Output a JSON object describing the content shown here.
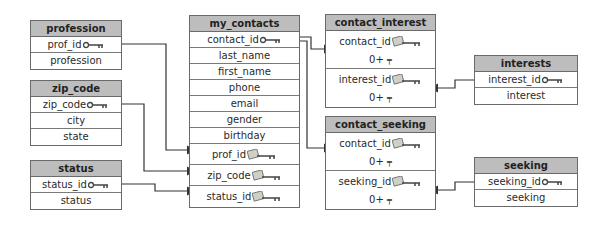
{
  "tables": {
    "profession": {
      "title": "profession",
      "fields": [
        "prof_id",
        "profession"
      ]
    },
    "zip_code": {
      "title": "zip_code",
      "fields": [
        "zip_code",
        "city",
        "state"
      ]
    },
    "status": {
      "title": "status",
      "fields": [
        "status_id",
        "status"
      ]
    },
    "my_contacts": {
      "title": "my_contacts",
      "fields": [
        "contact_id",
        "last_name",
        "first_name",
        "phone",
        "email",
        "gender",
        "birthday",
        "prof_id",
        "zip_code",
        "status_id"
      ]
    },
    "contact_interest": {
      "title": "contact_interest",
      "fields": [
        "contact_id",
        "interest_id"
      ],
      "cardinality": "0+"
    },
    "contact_seeking": {
      "title": "contact_seeking",
      "fields": [
        "contact_id",
        "seeking_id"
      ],
      "cardinality": "0+"
    },
    "interests": {
      "title": "interests",
      "fields": [
        "interest_id",
        "interest"
      ]
    },
    "seeking": {
      "title": "seeking",
      "fields": [
        "seeking_id",
        "seeking"
      ]
    }
  },
  "icons": {
    "primary_key": "key-icon",
    "foreign_key": "foreign-key-icon"
  },
  "colors": {
    "header": "#bdbdbd",
    "border": "#6a6a6a",
    "line": "#333333"
  }
}
